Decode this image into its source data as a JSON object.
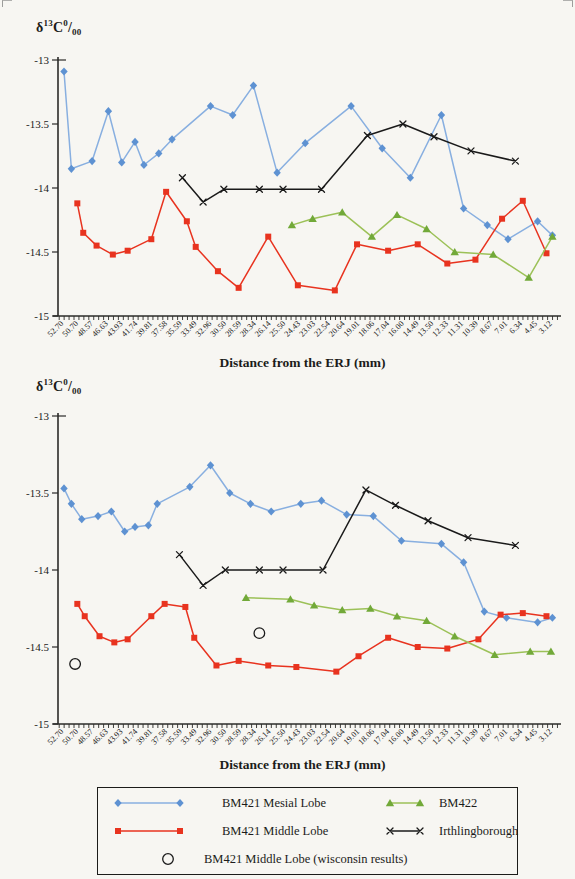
{
  "page_background": "#f7f6f2",
  "y_axis_label": {
    "delta": "δ",
    "mass_number": "13",
    "element": "C",
    "sup_zero": "0",
    "slash": "/",
    "sub_zeros": "00"
  },
  "x_axis_title": "Distance from the ERJ (mm)",
  "y_tick_labels": [
    "-13",
    "-13.5",
    "-14",
    "-14.5",
    "-15"
  ],
  "colors": {
    "mesial_line": "#88afe0",
    "mesial_marker": "#5e92d2",
    "middle_line": "#e8331f",
    "middle_marker": "#e8331f",
    "bm422_line": "#9cc158",
    "bm422_marker": "#72a939",
    "irthlingborough": "#1a1a1a",
    "wisconsin": "#1a1a1a",
    "axis": "#2b2b28"
  },
  "legend": {
    "items": [
      {
        "label": "BM421 Mesial Lobe",
        "series": "mesial"
      },
      {
        "label": "BM422",
        "series": "bm422"
      },
      {
        "label": "BM421 Middle Lobe",
        "series": "middle"
      },
      {
        "label": "Irthlingborough",
        "series": "irthlingborough"
      },
      {
        "label": "BM421 Middle Lobe (wisconsin results)",
        "series": "wisconsin"
      }
    ]
  },
  "chart_data": [
    {
      "type": "line",
      "position": "top",
      "title": "",
      "ylabel": "δ13C 0/00",
      "xlabel": "Distance from the ERJ (mm)",
      "ylim": [
        -15,
        -13
      ],
      "yticks": [
        -13,
        -13.5,
        -14,
        -14.5,
        -15
      ],
      "grid": false,
      "x_categories": [
        "52.70",
        "50.70",
        "48.57",
        "46.63",
        "43.93",
        "41.74",
        "39.81",
        "37.58",
        "35.59",
        "33.49",
        "32.96",
        "30.50",
        "28.59",
        "28.34",
        "26.14",
        "25.50",
        "24.43",
        "23.03",
        "22.54",
        "20.64",
        "19.01",
        "18.06",
        "17.04",
        "16.00",
        "14.49",
        "13.50",
        "12.33",
        "11.31",
        "10.39",
        "8.67",
        "7.01",
        "6.34",
        "4.45",
        "3.12"
      ],
      "series": [
        {
          "name": "BM421 Mesial Lobe",
          "marker": "diamond",
          "color": "#5e92d2",
          "line_color": "#88afe0",
          "points": [
            [
              0,
              -13.09
            ],
            [
              0.5,
              -13.85
            ],
            [
              1.9,
              -13.79
            ],
            [
              3,
              -13.4
            ],
            [
              3.9,
              -13.8
            ],
            [
              4.8,
              -13.64
            ],
            [
              5.4,
              -13.82
            ],
            [
              6.4,
              -13.73
            ],
            [
              7.3,
              -13.62
            ],
            [
              9.9,
              -13.36
            ],
            [
              11.4,
              -13.43
            ],
            [
              12.8,
              -13.2
            ],
            [
              14.4,
              -13.88
            ],
            [
              16.3,
              -13.65
            ],
            [
              19.4,
              -13.36
            ],
            [
              21.5,
              -13.69
            ],
            [
              23.4,
              -13.92
            ],
            [
              25.5,
              -13.43
            ],
            [
              27,
              -14.16
            ],
            [
              28.6,
              -14.29
            ],
            [
              30,
              -14.4
            ],
            [
              32,
              -14.26
            ],
            [
              33,
              -14.37
            ]
          ]
        },
        {
          "name": "BM421 Middle Lobe",
          "marker": "square",
          "color": "#e8331f",
          "line_color": "#e8331f",
          "points": [
            [
              0.9,
              -14.12
            ],
            [
              1.3,
              -14.35
            ],
            [
              2.2,
              -14.45
            ],
            [
              3.3,
              -14.52
            ],
            [
              4.3,
              -14.49
            ],
            [
              5.9,
              -14.4
            ],
            [
              6.9,
              -14.03
            ],
            [
              8.3,
              -14.26
            ],
            [
              8.9,
              -14.46
            ],
            [
              10.4,
              -14.65
            ],
            [
              11.8,
              -14.78
            ],
            [
              13.8,
              -14.38
            ],
            [
              15.8,
              -14.76
            ],
            [
              18.3,
              -14.8
            ],
            [
              19.8,
              -14.44
            ],
            [
              21.9,
              -14.49
            ],
            [
              23.9,
              -14.44
            ],
            [
              25.9,
              -14.59
            ],
            [
              27.8,
              -14.56
            ],
            [
              29.6,
              -14.24
            ],
            [
              31,
              -14.1
            ],
            [
              32.6,
              -14.51
            ]
          ]
        },
        {
          "name": "BM422",
          "marker": "triangle",
          "color": "#72a939",
          "line_color": "#9cc158",
          "points": [
            [
              15.4,
              -14.29
            ],
            [
              16.8,
              -14.24
            ],
            [
              18.8,
              -14.19
            ],
            [
              20.8,
              -14.38
            ],
            [
              22.5,
              -14.21
            ],
            [
              24.5,
              -14.32
            ],
            [
              26.4,
              -14.5
            ],
            [
              29,
              -14.52
            ],
            [
              31.4,
              -14.7
            ],
            [
              33,
              -14.38
            ]
          ]
        },
        {
          "name": "Irthlingborough",
          "marker": "x",
          "color": "#1a1a1a",
          "line_color": "#1a1a1a",
          "points": [
            [
              8,
              -13.92
            ],
            [
              9.4,
              -14.11
            ],
            [
              10.8,
              -14.01
            ],
            [
              13.2,
              -14.01
            ],
            [
              14.8,
              -14.01
            ],
            [
              17.4,
              -14.01
            ],
            [
              20.5,
              -13.59
            ],
            [
              22.9,
              -13.5
            ],
            [
              25,
              -13.6
            ],
            [
              27.5,
              -13.71
            ],
            [
              30.5,
              -13.79
            ]
          ]
        }
      ]
    },
    {
      "type": "line",
      "position": "bottom",
      "title": "",
      "ylabel": "δ13C 0/00",
      "xlabel": "Distance from the ERJ (mm)",
      "ylim": [
        -15,
        -13
      ],
      "yticks": [
        -13,
        -13.5,
        -14,
        -14.5,
        -15
      ],
      "grid": false,
      "x_categories": [
        "52.70",
        "50.70",
        "48.57",
        "46.63",
        "43.93",
        "41.74",
        "39.81",
        "37.58",
        "35.59",
        "33.49",
        "32.96",
        "30.50",
        "28.59",
        "28.34",
        "26.14",
        "25.50",
        "24.43",
        "23.03",
        "22.54",
        "20.64",
        "19.01",
        "18.06",
        "17.04",
        "16.00",
        "14.49",
        "13.50",
        "12.33",
        "11.31",
        "10.39",
        "8.67",
        "7.01",
        "6.34",
        "4.45",
        "3.12"
      ],
      "series": [
        {
          "name": "BM421 Mesial Lobe",
          "marker": "diamond",
          "color": "#5e92d2",
          "line_color": "#88afe0",
          "points": [
            [
              0,
              -13.47
            ],
            [
              0.5,
              -13.57
            ],
            [
              1.2,
              -13.67
            ],
            [
              2.3,
              -13.65
            ],
            [
              3.2,
              -13.62
            ],
            [
              4.1,
              -13.75
            ],
            [
              4.8,
              -13.72
            ],
            [
              5.7,
              -13.71
            ],
            [
              6.3,
              -13.57
            ],
            [
              8.5,
              -13.46
            ],
            [
              9.9,
              -13.32
            ],
            [
              11.2,
              -13.5
            ],
            [
              12.6,
              -13.57
            ],
            [
              14,
              -13.62
            ],
            [
              16,
              -13.57
            ],
            [
              17.4,
              -13.55
            ],
            [
              19.1,
              -13.64
            ],
            [
              20.9,
              -13.65
            ],
            [
              22.8,
              -13.81
            ],
            [
              25.5,
              -13.83
            ],
            [
              27,
              -13.95
            ],
            [
              28.4,
              -14.27
            ],
            [
              29.9,
              -14.31
            ],
            [
              32,
              -14.34
            ],
            [
              33,
              -14.31
            ]
          ]
        },
        {
          "name": "BM421 Middle Lobe",
          "marker": "square",
          "color": "#e8331f",
          "line_color": "#e8331f",
          "points": [
            [
              0.9,
              -14.22
            ],
            [
              1.4,
              -14.3
            ],
            [
              2.4,
              -14.43
            ],
            [
              3.4,
              -14.47
            ],
            [
              4.3,
              -14.45
            ],
            [
              5.9,
              -14.3
            ],
            [
              6.8,
              -14.22
            ],
            [
              8.2,
              -14.24
            ],
            [
              8.8,
              -14.44
            ],
            [
              10.3,
              -14.62
            ],
            [
              11.8,
              -14.59
            ],
            [
              13.8,
              -14.62
            ],
            [
              15.7,
              -14.63
            ],
            [
              18.4,
              -14.66
            ],
            [
              19.9,
              -14.56
            ],
            [
              21.9,
              -14.44
            ],
            [
              23.9,
              -14.5
            ],
            [
              25.9,
              -14.51
            ],
            [
              28,
              -14.45
            ],
            [
              29.5,
              -14.29
            ],
            [
              31,
              -14.28
            ],
            [
              32.6,
              -14.3
            ]
          ]
        },
        {
          "name": "BM422",
          "marker": "triangle",
          "color": "#72a939",
          "line_color": "#9cc158",
          "points": [
            [
              12.3,
              -14.18
            ],
            [
              15.3,
              -14.19
            ],
            [
              16.9,
              -14.23
            ],
            [
              18.8,
              -14.26
            ],
            [
              20.7,
              -14.25
            ],
            [
              22.5,
              -14.3
            ],
            [
              24.5,
              -14.33
            ],
            [
              26.4,
              -14.43
            ],
            [
              29.1,
              -14.55
            ],
            [
              31.5,
              -14.53
            ],
            [
              32.9,
              -14.53
            ]
          ]
        },
        {
          "name": "Irthlingborough",
          "marker": "x",
          "color": "#1a1a1a",
          "line_color": "#1a1a1a",
          "points": [
            [
              7.8,
              -13.9
            ],
            [
              9.4,
              -14.1
            ],
            [
              10.9,
              -14
            ],
            [
              13.2,
              -14
            ],
            [
              14.8,
              -14
            ],
            [
              17.5,
              -14
            ],
            [
              20.4,
              -13.48
            ],
            [
              22.4,
              -13.58
            ],
            [
              24.6,
              -13.68
            ],
            [
              27.3,
              -13.79
            ],
            [
              30.5,
              -13.84
            ]
          ]
        },
        {
          "name": "BM421 Middle Lobe (wisconsin results)",
          "marker": "circle-open",
          "color": "#1a1a1a",
          "line_color": "none",
          "show_line": false,
          "points": [
            [
              0.75,
              -14.61
            ],
            [
              13.2,
              -14.41
            ]
          ]
        }
      ]
    }
  ]
}
